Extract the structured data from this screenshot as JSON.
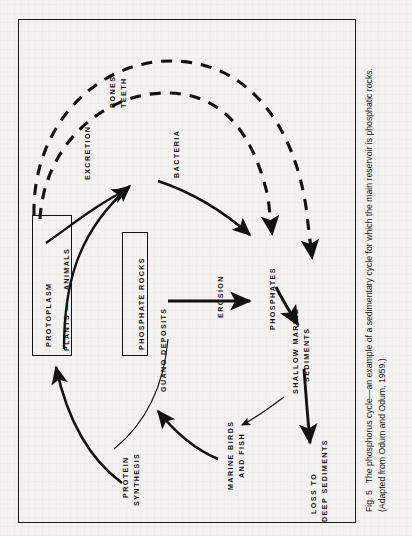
{
  "figure": {
    "caption_number": "Fig. 5",
    "caption_text": "The phosphorus cycle—an example of a sedimentary cycle for which the main reservoir is phosphatic rocks. (Adapted from Odum and Odum, 1959.)",
    "orientation": "rotated-90-ccw",
    "frame_color": "#1a1a1a",
    "background_color": "#f3f2f0",
    "ink_color": "#111111"
  },
  "diagram": {
    "type": "cycle-diagram",
    "title": "The phosphorus cycle",
    "boxes": [
      {
        "id": "protoplasm",
        "line1": "PROTOPLASM",
        "line2": "PLANTS —→ ANIMALS"
      },
      {
        "id": "phosphate-rocks",
        "line1": "PHOSPHATE ROCKS"
      }
    ],
    "labels": [
      {
        "id": "bones-teeth",
        "line1": "BONES",
        "line2": "TEETH"
      },
      {
        "id": "excretion",
        "line1": "EXCRETION"
      },
      {
        "id": "bacteria",
        "line1": "BACTERIA"
      },
      {
        "id": "erosion",
        "line1": "EROSION"
      },
      {
        "id": "phosphates",
        "line1": "PHOSPHATES"
      },
      {
        "id": "shallow-marine-sediments",
        "line1": "SHALLOW MARINE",
        "line2": "SEDIMENTS"
      },
      {
        "id": "guano-deposits",
        "line1": "GUANO DEPOSITS"
      },
      {
        "id": "protein-synthesis",
        "line1": "PROTEIN",
        "line2": "SYNTHESIS"
      },
      {
        "id": "marine-birds-and-fish",
        "line1": "MARINE BIRDS",
        "line2": "AND FISH"
      },
      {
        "id": "loss-to-deep-sediments",
        "line1": "LOSS TO",
        "line2": "DEEP SEDIMENTS"
      }
    ],
    "flows": [
      {
        "id": "protoplasm-to-bacteria",
        "from": "PROTOPLASM",
        "to": "BACTERIA",
        "style": "solid"
      },
      {
        "id": "phosphate-rocks-to-bacteria",
        "from": "PHOSPHATE ROCKS",
        "to": "BACTERIA",
        "style": "solid"
      },
      {
        "id": "bacteria-to-phosphates",
        "from": "BACTERIA",
        "to": "PHOSPHATES",
        "style": "solid"
      },
      {
        "id": "excretion-dashed",
        "from": "PROTOPLASM",
        "to": "PHOSPHATES",
        "style": "dashed",
        "label": "EXCRETION"
      },
      {
        "id": "bones-teeth-dashed",
        "from": "PROTOPLASM",
        "to": "SHALLOW MARINE SEDIMENTS",
        "style": "dashed",
        "label": "BONES TEETH"
      },
      {
        "id": "erosion-arrow",
        "from": "PHOSPHATE ROCKS / GUANO DEPOSITS",
        "to": "PHOSPHATES",
        "style": "solid",
        "label": "EROSION"
      },
      {
        "id": "phosphates-to-sediments",
        "from": "PHOSPHATES",
        "to": "SHALLOW MARINE SEDIMENTS",
        "style": "solid"
      },
      {
        "id": "sediments-to-deep",
        "from": "SHALLOW MARINE SEDIMENTS",
        "to": "LOSS TO DEEP SEDIMENTS",
        "style": "solid"
      },
      {
        "id": "phosphates-to-marine-birds",
        "from": "PHOSPHATES",
        "to": "MARINE BIRDS AND FISH",
        "style": "solid-thin"
      },
      {
        "id": "marine-birds-to-guano",
        "from": "MARINE BIRDS AND FISH",
        "to": "GUANO DEPOSITS",
        "style": "solid"
      },
      {
        "id": "protein-synthesis-to-protoplasm",
        "from": "PROTEIN SYNTHESIS",
        "to": "PROTOPLASM",
        "style": "solid",
        "label": "PROTEIN SYNTHESIS"
      }
    ]
  }
}
